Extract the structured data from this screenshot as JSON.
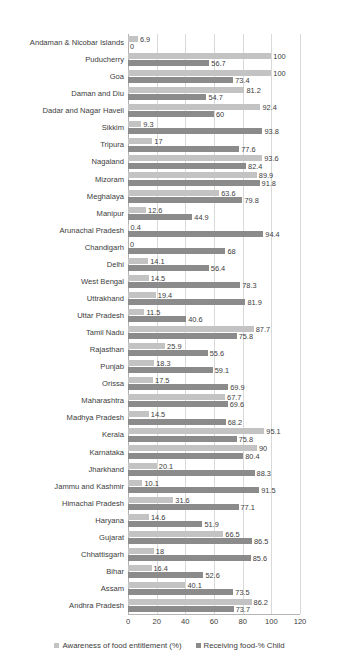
{
  "chart_data": {
    "type": "bar",
    "orientation": "horizontal",
    "title": "",
    "xlabel": "",
    "ylabel": "",
    "xlim": [
      0,
      120
    ],
    "xticks": [
      0,
      20,
      40,
      60,
      80,
      100,
      120
    ],
    "grid": true,
    "legend_position": "bottom",
    "colors": {
      "awareness": "#c3c3c3",
      "receiving": "#8b8b8b",
      "gridline": "#d9d9d9",
      "text": "#3c3c3c"
    },
    "series": [
      {
        "name": "Awareness of food entitlement (%)",
        "key": "awareness",
        "color": "#c3c3c3",
        "values": [
          6.9,
          100,
          100,
          81.2,
          92.4,
          9.3,
          17,
          93.6,
          89.9,
          63.6,
          12.6,
          0.4,
          0,
          14.1,
          14.5,
          19.4,
          11.5,
          87.7,
          25.9,
          18.3,
          17.5,
          67.7,
          14.5,
          95.1,
          90,
          20.1,
          10.1,
          31.6,
          14.6,
          66.5,
          18,
          16.4,
          40.1,
          86.2
        ]
      },
      {
        "name": "Receiving food-% Child",
        "key": "receiving",
        "color": "#8b8b8b",
        "values": [
          0,
          56.7,
          73.4,
          54.7,
          60,
          93.8,
          77.6,
          82.4,
          91.8,
          79.8,
          44.9,
          94.4,
          68,
          56.4,
          78.3,
          81.9,
          40.6,
          75.8,
          55.6,
          59.1,
          69.9,
          69.6,
          68.2,
          75.8,
          80.4,
          88.3,
          91.5,
          77.1,
          51.9,
          86.5,
          85.6,
          52.6,
          73.5,
          73.7
        ]
      }
    ],
    "categories": [
      "Andaman & Nicobar Islands",
      "Puducherry",
      "Goa",
      "Daman and Diu",
      "Dadar and Nagar Haveli",
      "Sikkim",
      "Tripura",
      "Nagaland",
      "Mizoram",
      "Meghalaya",
      "Manipur",
      "Arunachal Pradesh",
      "Chandigarh",
      "Delhi",
      "West Bengal",
      "Uttrakhand",
      "Uttar Pradesh",
      "Tamil Nadu",
      "Rajasthan",
      "Punjab",
      "Orissa",
      "Maharashtra",
      "Madhya Pradesh",
      "Kerala",
      "Karnataka",
      "Jharkhand",
      "Jammu and Kashmir",
      "Himachal Pradesh",
      "Haryana",
      "Gujarat",
      "Chhattisgarh",
      "Bihar",
      "Assam",
      "Andhra Pradesh"
    ],
    "data_labels": {
      "awareness": [
        "6.9",
        "100",
        "100",
        "81.2",
        "92.4",
        "9.3",
        "17",
        "93.6",
        "89.9",
        "63.6",
        "12.6",
        "0.4",
        "0",
        "14.1",
        "14.5",
        "19.4",
        "11.5",
        "87.7",
        "25.9",
        "18.3",
        "17.5",
        "67.7",
        "14.5",
        "95.1",
        "90",
        "20.1",
        "10.1",
        "31.6",
        "14.6",
        "66.5",
        "18",
        "16.4",
        "40.1",
        "86.2"
      ],
      "receiving": [
        "0",
        "56.7",
        "73.4",
        "54.7",
        "60",
        "93.8",
        "77.6",
        "82.4",
        "91.8",
        "79.8",
        "44.9",
        "94.4",
        "68",
        "56.4",
        "78.3",
        "81.9",
        "40.6",
        "75.8",
        "55.6",
        "59.1",
        "69.9",
        "69.6",
        "68.2",
        "75.8",
        "80.4",
        "88.3",
        "91.5",
        "77.1",
        "51.9",
        "86.5",
        "85.6",
        "52.6",
        "73.5",
        "73.7"
      ]
    },
    "xtick_labels": [
      "0",
      "20",
      "40",
      "60",
      "80",
      "100",
      "120"
    ]
  },
  "legend": {
    "items": [
      {
        "label": "Awareness of food entitlement (%)",
        "key": "awareness"
      },
      {
        "label": "Receiving food-% Child",
        "key": "receiving"
      }
    ]
  }
}
